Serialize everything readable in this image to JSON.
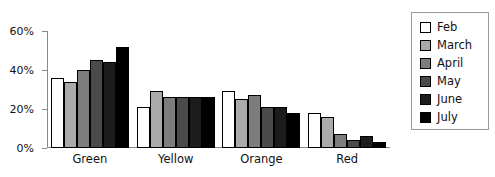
{
  "chart_data": {
    "type": "bar",
    "title": "",
    "subtitle": "",
    "xlabel": "",
    "ylabel": "",
    "categories": [
      "Green",
      "Yellow",
      "Orange",
      "Red"
    ],
    "series": [
      {
        "name": "Feb",
        "color": "#ffffff",
        "values": [
          36,
          21,
          29,
          18
        ]
      },
      {
        "name": "March",
        "color": "#aaaaaa",
        "values": [
          34,
          29,
          25,
          16
        ]
      },
      {
        "name": "April",
        "color": "#7d7d7d",
        "values": [
          40,
          26,
          27,
          7
        ]
      },
      {
        "name": "May",
        "color": "#4a4a4a",
        "values": [
          45,
          26,
          21,
          4
        ]
      },
      {
        "name": "June",
        "color": "#1c1c1c",
        "values": [
          44,
          26,
          21,
          6
        ]
      },
      {
        "name": "July",
        "color": "#000000",
        "values": [
          52,
          26,
          18,
          3
        ]
      }
    ],
    "ylim": [
      0,
      60
    ],
    "yticks": [
      0,
      20,
      40,
      60
    ],
    "ytick_labels": [
      "0%",
      "20%",
      "40%",
      "60%"
    ],
    "grid": false,
    "legend_position": "right",
    "value_unit": "%"
  }
}
